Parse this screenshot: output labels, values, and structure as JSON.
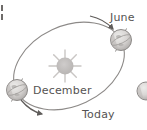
{
  "figure": {
    "type": "orbital-diagram",
    "background_color": "#ffffff"
  },
  "labels": {
    "june": "June",
    "december": "December",
    "today": "Today"
  },
  "colors": {
    "orbit_line": "#8d8a88",
    "label_text": "#555352",
    "sun_body": "#b8b5b3",
    "sun_rays": "#c9c6c4",
    "earth_fill": "#d6d3d1",
    "earth_outline": "#8d8a88",
    "earth_shadow": "#a3a09e",
    "arrow": "#5f5c5a"
  },
  "elements": {
    "sun": {
      "name": "sun",
      "cx": 65,
      "cy": 66,
      "radius": 9,
      "ray_count": 8
    },
    "earth_june": {
      "name": "earth-june",
      "cx": 121,
      "cy": 40,
      "radius": 11
    },
    "earth_december": {
      "name": "earth-december",
      "cx": 17,
      "cy": 90,
      "radius": 11
    },
    "earth_partial_right": {
      "name": "earth-partial",
      "cx": 146,
      "cy": 91,
      "radius": 9
    },
    "orbit": {
      "name": "orbit-ellipse",
      "cx": 69,
      "cy": 66,
      "rx": 58,
      "ry": 40,
      "rotation_deg": -25
    },
    "arrow_june": {
      "name": "direction-arrow-june",
      "points_to": "June"
    },
    "arrow_december": {
      "name": "direction-arrow-december",
      "points_to": "counterclockwise"
    }
  }
}
